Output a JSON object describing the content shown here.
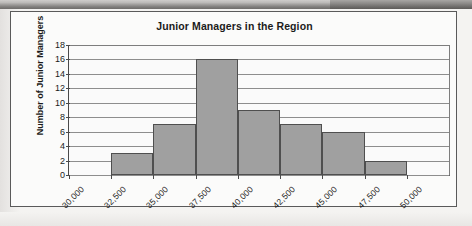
{
  "chart_data": {
    "type": "bar",
    "title": "Junior Managers in the Region",
    "xlabel": "",
    "ylabel": "Number of Junior Managers",
    "ylim": [
      0,
      18
    ],
    "ytick_step": 2,
    "grid": true,
    "legend": "none",
    "bin_edges": [
      "30,000",
      "32,500",
      "35,000",
      "37,500",
      "40,000",
      "42,500",
      "45,000",
      "47,500",
      "50,000"
    ],
    "xtick_labels": [
      "30,000",
      "32,500",
      "35,000",
      "37,500",
      "40,000",
      "42,500",
      "45,000",
      "47,500",
      "50,000"
    ],
    "ytick_labels": [
      "0",
      "2",
      "4",
      "6",
      "8",
      "10",
      "12",
      "14",
      "16",
      "18"
    ],
    "categories": [
      "30,000-32,500",
      "32,500-35,000",
      "35,000-37,500",
      "37,500-40,000",
      "40,000-42,500",
      "42,500-45,000",
      "45,000-47,500",
      "47,500-50,000"
    ],
    "values": [
      0,
      3,
      7,
      16,
      9,
      7,
      6,
      2
    ],
    "bar_color": "#a0a0a0",
    "bar_border_color": "#4f4f4f",
    "plot_background": "#fafafa",
    "gridline_color": "#8d8d8d",
    "axis_color": "#4a4a4a",
    "text_color": "#1b1b1b"
  }
}
